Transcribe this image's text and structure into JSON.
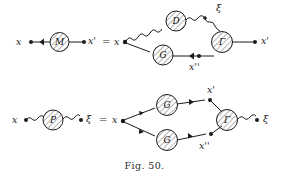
{
  "figure": {
    "caption": "Fig. 50.",
    "background_color": "#ffffff",
    "ink_color": "#1d1d1d",
    "width": 289,
    "height": 181
  },
  "equations": [
    {
      "id": "mass-operator-equation",
      "equals_sign": "=",
      "lhs": {
        "left_label": "x",
        "blob_label": "M",
        "right_label": "x'"
      },
      "rhs": {
        "left_label": "x",
        "right_label": "x'",
        "photon_vertex_label": "ξ",
        "lower_vertex_label": "x''",
        "blobs": [
          {
            "label": "D",
            "kind": "photon-propagator"
          },
          {
            "label": "G",
            "kind": "electron-propagator"
          },
          {
            "label": "Γ",
            "kind": "vertex-function"
          }
        ]
      }
    },
    {
      "id": "polarization-operator-equation",
      "equals_sign": "=",
      "lhs": {
        "left_label": "x",
        "blob_label": "P",
        "right_label": "ξ"
      },
      "rhs": {
        "left_label": "x",
        "right_label": "ξ",
        "upper_vertex_label": "x'",
        "lower_vertex_label": "x''",
        "blobs": [
          {
            "label": "G",
            "kind": "electron-propagator"
          },
          {
            "label": "G",
            "kind": "electron-propagator"
          },
          {
            "label": "Γ",
            "kind": "vertex-function"
          }
        ]
      }
    }
  ],
  "labels": {
    "x": "x",
    "x_prime": "x'",
    "x_double_prime": "x''",
    "xi": "ξ",
    "M": "M",
    "P": "P",
    "D": "D",
    "G": "G",
    "Gamma": "Γ",
    "equals": "="
  }
}
